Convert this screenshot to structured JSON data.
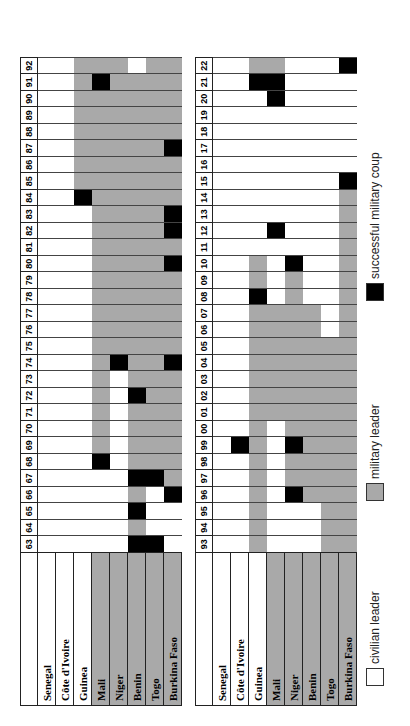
{
  "title": "",
  "chart_data": {
    "type": "table",
    "countries": [
      "Senegal",
      "Côte d'Ivoire",
      "Guinea",
      "Mali",
      "Niger",
      "Benin",
      "Togo",
      "Burkina Faso"
    ],
    "legend": [
      {
        "code": "W",
        "label": "civilian leader",
        "color": "#ffffff"
      },
      {
        "code": "G",
        "label": "military leader",
        "color": "#a9a9a9"
      },
      {
        "code": "B",
        "label": "successful military coup",
        "color": "#000000"
      }
    ],
    "tables": [
      {
        "years": [
          "63",
          "64",
          "65",
          "66",
          "67",
          "68",
          "69",
          "70",
          "71",
          "72",
          "73",
          "74",
          "75",
          "76",
          "77",
          "78",
          "79",
          "80",
          "81",
          "82",
          "83",
          "84",
          "85",
          "86",
          "87",
          "88",
          "89",
          "90",
          "91",
          "92"
        ],
        "rows": {
          "Senegal": "WWWWWWWWWWWWWWWWWWWWWWWWWWWWWW",
          "Côte d'Ivoire": "WWWWWWWWWWWWWWWWWWWWWWWWWWWWWW",
          "Guinea": "WWWWWWWWWWWWWWWWWWWWWBGGGGGGGG",
          "Mali": "WWWWWBGGGGGGGGGGGGGGGGGGGGGGBG",
          "Niger": "WWWWWWWWWWWBGGGGGGGGGGGGGGGGGG",
          "Benin": "BGBGBGGGGBGGGGGGGGGGGGGGGGGGGW",
          "Togo": "BWWWBGGGGGGGGGGGGGGGGGGGGGGGGG",
          "Burkina Faso": "WWWBGGGGGGGBGGGGGBGBBGGGBGGGGG"
        },
        "row_label_shading": {
          "Senegal": "W",
          "Côte d'Ivoire": "W",
          "Guinea": "W",
          "Mali": "G",
          "Niger": "G",
          "Benin": "G",
          "Togo": "G",
          "Burkina Faso": "G"
        }
      },
      {
        "years": [
          "93",
          "94",
          "95",
          "96",
          "97",
          "98",
          "99",
          "00",
          "01",
          "02",
          "03",
          "04",
          "05",
          "06",
          "07",
          "08",
          "09",
          "10",
          "11",
          "12",
          "13",
          "14",
          "15",
          "16",
          "17",
          "18",
          "19",
          "20",
          "21",
          "22"
        ],
        "rows": {
          "Senegal": "WWWWWWWWWWWWWWWWWWWWWWWWWWWWWW",
          "Côte d'Ivoire": "WWWWWWBWWWWWWWWWWWWWWWWWWWWWWW",
          "Guinea": "GGGGGGGGGGGGGGGBGGWWWWWWWWWWBG",
          "Mali": "WWWWWWWWGGGGGGGWWWWBWWWWWWWBBG",
          "Niger": "WWWBGGBGGGGGGGGGGBWWWWWWWWWWWW",
          "Benin": "WWWGGGGGGGGGGGGWWWWWWWWWWWWWWW",
          "Togo": "GGGGGGGGGGGGGWWWWWWWWWWWWWWWWW",
          "Burkina Faso": "GGGGGGGGGGGGGGGGGGGGGGBWWWWWWB"
        },
        "row_label_shading": {
          "Senegal": "W",
          "Côte d'Ivoire": "W",
          "Guinea": "W",
          "Mali": "G",
          "Niger": "G",
          "Benin": "G",
          "Togo": "G",
          "Burkina Faso": "G"
        }
      }
    ],
    "orientation": "rotated 90° counter-clockwise (years read bottom-to-top)"
  },
  "legend": {
    "civilian": "civilian leader",
    "military": "military leader",
    "coup": "successful military coup"
  }
}
